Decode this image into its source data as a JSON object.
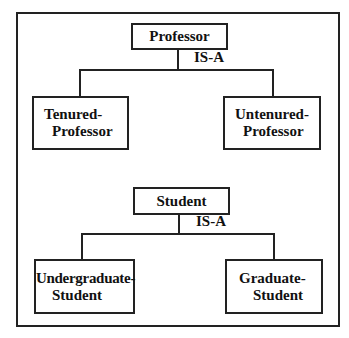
{
  "diagram": {
    "type": "IS-A hierarchy",
    "hierarchies": [
      {
        "parent": "Professor",
        "relation": "IS-A",
        "children": [
          {
            "line1": "Tenured-",
            "line2": "Professor"
          },
          {
            "line1": "Untenured-",
            "line2": "Professor"
          }
        ]
      },
      {
        "parent": "Student",
        "relation": "IS-A",
        "children": [
          {
            "line1": "Undergraduate-",
            "line2": "Student"
          },
          {
            "line1": "Graduate-",
            "line2": "Student"
          }
        ]
      }
    ]
  }
}
